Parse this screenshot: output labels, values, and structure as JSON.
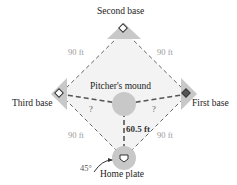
{
  "diagram": {
    "bases": {
      "second": "Second base",
      "third": "Third base",
      "first": "First base",
      "home": "Home plate"
    },
    "mound": "Pitcher's mound",
    "distances": {
      "home_to_first": "90 ft",
      "home_to_third": "90 ft",
      "second_to_first": "90 ft",
      "second_to_third": "90 ft",
      "mound_to_home": "60.5 ft",
      "mound_to_first": "?",
      "mound_to_third": "?"
    },
    "angle": "45°",
    "colors": {
      "base_fill": "#c8c8c8",
      "line": "#555555",
      "dim_text": "#9a9a9a"
    }
  }
}
